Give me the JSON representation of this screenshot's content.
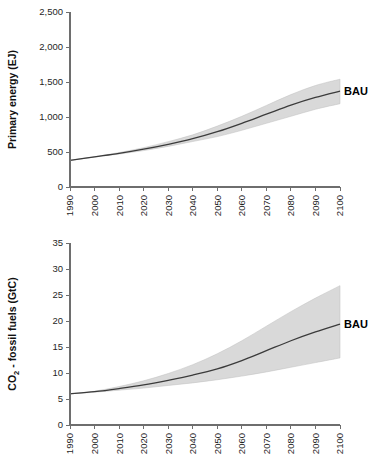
{
  "chart_data": [
    {
      "id": "primary-energy",
      "type": "area",
      "title": "",
      "xlabel": "",
      "ylabel": "Primary energy (EJ)",
      "ylabel_parts": {
        "main": "Primary energy (EJ)",
        "sub": ""
      },
      "x": [
        1990,
        2000,
        2010,
        2020,
        2030,
        2040,
        2050,
        2060,
        2070,
        2080,
        2090,
        2100
      ],
      "xlim": [
        1990,
        2100
      ],
      "ylim": [
        0,
        2500
      ],
      "yticks": [
        0,
        500,
        1000,
        1500,
        2000,
        2500
      ],
      "ytick_labels": [
        "0",
        "500",
        "1,000",
        "1,500",
        "2,000",
        "2,500"
      ],
      "xticks": [
        1990,
        2000,
        2010,
        2020,
        2030,
        2040,
        2050,
        2060,
        2070,
        2080,
        2090,
        2100
      ],
      "xtick_labels": [
        "1990",
        "2000",
        "2010",
        "2020",
        "2030",
        "2040",
        "2050",
        "2060",
        "2070",
        "2080",
        "2090",
        "2100"
      ],
      "grid": false,
      "legend_position": "right-inline",
      "series": [
        {
          "name": "BAU",
          "label": "BAU",
          "values": [
            380,
            430,
            480,
            540,
            610,
            690,
            790,
            910,
            1040,
            1170,
            1280,
            1370
          ],
          "lower": [
            380,
            428,
            470,
            520,
            580,
            650,
            720,
            810,
            910,
            1010,
            1110,
            1190
          ],
          "upper": [
            380,
            432,
            492,
            562,
            648,
            745,
            870,
            1010,
            1165,
            1320,
            1450,
            1540
          ],
          "band_label": "uncertainty range",
          "line_color": "#3b3b3b",
          "band_color": "#d9d9d9"
        }
      ]
    },
    {
      "id": "co2-fossil-fuels",
      "type": "area",
      "title": "",
      "xlabel": "",
      "ylabel": "CO2 - fossil fuels (GtC)",
      "ylabel_parts": {
        "pre": "CO",
        "sub": "2",
        "post": " - fossil fuels (GtC)"
      },
      "x": [
        1990,
        2000,
        2010,
        2020,
        2030,
        2040,
        2050,
        2060,
        2070,
        2080,
        2090,
        2100
      ],
      "xlim": [
        1990,
        2100
      ],
      "ylim": [
        0,
        35
      ],
      "yticks": [
        0,
        5,
        10,
        15,
        20,
        25,
        30,
        35
      ],
      "ytick_labels": [
        "0",
        "5",
        "10",
        "15",
        "20",
        "25",
        "30",
        "35"
      ],
      "xticks": [
        1990,
        2000,
        2010,
        2020,
        2030,
        2040,
        2050,
        2060,
        2070,
        2080,
        2090,
        2100
      ],
      "xtick_labels": [
        "1990",
        "2000",
        "2010",
        "2020",
        "2030",
        "2040",
        "2050",
        "2060",
        "2070",
        "2080",
        "2090",
        "2100"
      ],
      "grid": false,
      "legend_position": "right-inline",
      "series": [
        {
          "name": "BAU",
          "label": "BAU",
          "values": [
            6.0,
            6.4,
            7.0,
            7.7,
            8.6,
            9.6,
            10.8,
            12.4,
            14.3,
            16.2,
            17.9,
            19.4
          ],
          "lower": [
            6.0,
            6.3,
            6.7,
            7.1,
            7.6,
            8.1,
            8.7,
            9.4,
            10.2,
            11.1,
            12.0,
            12.9
          ],
          "upper": [
            6.0,
            6.5,
            7.4,
            8.5,
            9.9,
            11.6,
            13.7,
            16.2,
            19.0,
            21.8,
            24.4,
            26.8
          ],
          "band_label": "uncertainty range",
          "line_color": "#3b3b3b",
          "band_color": "#d9d9d9"
        }
      ]
    }
  ],
  "figures": {
    "primary_energy": {
      "name": "Primary energy projection",
      "series_label": "BAU",
      "y_axis_label": "Primary energy (EJ)"
    },
    "co2": {
      "name": "CO2 fossil fuel emissions projection",
      "series_label": "BAU",
      "y_axis_label_pre": "CO",
      "y_axis_label_sub": "2",
      "y_axis_label_post": " - fossil fuels (GtC)"
    }
  }
}
